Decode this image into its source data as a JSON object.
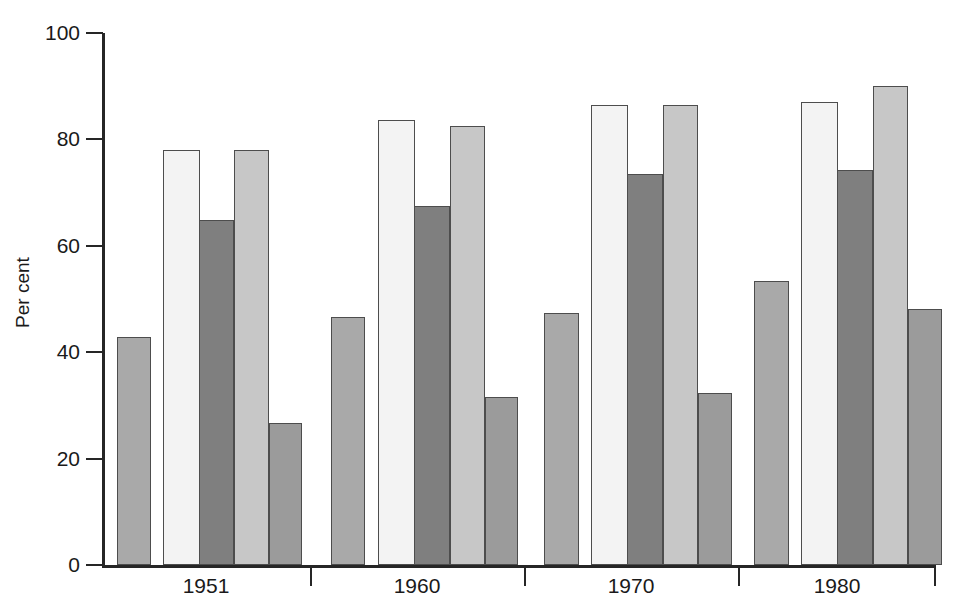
{
  "chart_data": {
    "type": "bar",
    "title": "",
    "subtitle": "",
    "xlabel": "",
    "ylabel": "Per cent",
    "ylim": [
      0,
      100
    ],
    "yticks": [
      0,
      20,
      40,
      60,
      80,
      100
    ],
    "ytick_labels": [
      "0",
      "20",
      "40",
      "60",
      "80",
      "100"
    ],
    "grid": false,
    "legend": "none",
    "categories": [
      "1951",
      "1960",
      "1970",
      "1980"
    ],
    "series": [
      {
        "name": "series-1",
        "color": "#a9a9a9",
        "values": [
          42.8,
          46.6,
          47.4,
          53.3
        ]
      },
      {
        "name": "series-2",
        "color": "#f3f3f3",
        "values": [
          78.0,
          83.6,
          86.4,
          87.1
        ]
      },
      {
        "name": "series-3",
        "color": "#7f7f7f",
        "values": [
          64.9,
          67.5,
          73.5,
          74.2
        ]
      },
      {
        "name": "series-4",
        "color": "#c7c7c7",
        "values": [
          78.0,
          82.6,
          86.4,
          90.1
        ]
      },
      {
        "name": "series-5",
        "color": "#9b9b9b",
        "values": [
          26.7,
          31.6,
          32.4,
          48.1
        ]
      }
    ],
    "bars": [
      {
        "group": "1951",
        "series": "series-1",
        "value": 42.8,
        "color": "#a9a9a9",
        "x": 117,
        "w": 34
      },
      {
        "group": "1951",
        "series": "series-2",
        "value": 78.0,
        "color": "#f3f3f3",
        "x": 163,
        "w": 37
      },
      {
        "group": "1951",
        "series": "series-3",
        "value": 64.9,
        "color": "#7f7f7f",
        "x": 199,
        "w": 35
      },
      {
        "group": "1951",
        "series": "series-4",
        "value": 78.0,
        "color": "#c7c7c7",
        "x": 234,
        "w": 35
      },
      {
        "group": "1951",
        "series": "series-5",
        "value": 26.7,
        "color": "#9b9b9b",
        "x": 269,
        "w": 33
      },
      {
        "group": "1960",
        "series": "series-1",
        "value": 46.6,
        "color": "#a9a9a9",
        "x": 331,
        "w": 34
      },
      {
        "group": "1960",
        "series": "series-2",
        "value": 83.6,
        "color": "#f3f3f3",
        "x": 378,
        "w": 37
      },
      {
        "group": "1960",
        "series": "series-3",
        "value": 67.5,
        "color": "#7f7f7f",
        "x": 414,
        "w": 36
      },
      {
        "group": "1960",
        "series": "series-4",
        "value": 82.6,
        "color": "#c7c7c7",
        "x": 450,
        "w": 35
      },
      {
        "group": "1960",
        "series": "series-5",
        "value": 31.6,
        "color": "#9b9b9b",
        "x": 485,
        "w": 33
      },
      {
        "group": "1970",
        "series": "series-1",
        "value": 47.4,
        "color": "#a9a9a9",
        "x": 544,
        "w": 35
      },
      {
        "group": "1970",
        "series": "series-2",
        "value": 86.4,
        "color": "#f3f3f3",
        "x": 591,
        "w": 37
      },
      {
        "group": "1970",
        "series": "series-3",
        "value": 73.5,
        "color": "#7f7f7f",
        "x": 627,
        "w": 36
      },
      {
        "group": "1970",
        "series": "series-4",
        "value": 86.4,
        "color": "#c7c7c7",
        "x": 663,
        "w": 35
      },
      {
        "group": "1970",
        "series": "series-5",
        "value": 32.4,
        "color": "#9b9b9b",
        "x": 698,
        "w": 34
      },
      {
        "group": "1980",
        "series": "series-1",
        "value": 53.3,
        "color": "#a9a9a9",
        "x": 754,
        "w": 35
      },
      {
        "group": "1980",
        "series": "series-2",
        "value": 87.1,
        "color": "#f3f3f3",
        "x": 801,
        "w": 37
      },
      {
        "group": "1980",
        "series": "series-3",
        "value": 74.2,
        "color": "#7f7f7f",
        "x": 837,
        "w": 36
      },
      {
        "group": "1980",
        "series": "series-4",
        "value": 90.1,
        "color": "#c7c7c7",
        "x": 873,
        "w": 35
      },
      {
        "group": "1980",
        "series": "series-5",
        "value": 48.1,
        "color": "#9b9b9b",
        "x": 908,
        "w": 34
      }
    ],
    "group_separators_x": [
      310,
      524,
      738
    ],
    "axis_origin_y": 565,
    "axis_top_y": 33,
    "axis_left_x": 102,
    "axis_right_x": 936,
    "axis_color": "#262626",
    "bar_border_color": "#4d4d4d",
    "background_color": "#ffffff"
  },
  "axis": {
    "y_title": "Per cent",
    "y_labels": [
      "100",
      "80",
      "60",
      "40",
      "20",
      "0"
    ],
    "x_labels": [
      "1951",
      "1960",
      "1970",
      "1980"
    ]
  }
}
